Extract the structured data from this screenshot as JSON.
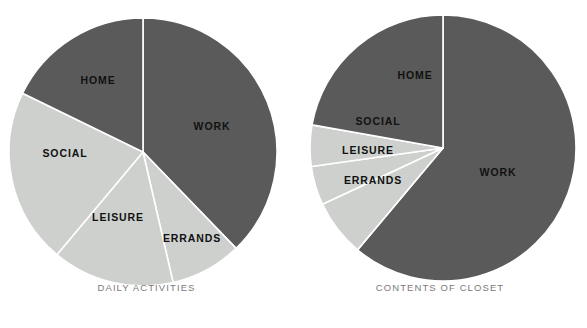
{
  "figure": {
    "background": "#ffffff",
    "label_color": "#111111",
    "caption_color": "#7a7a7a",
    "divider_color": "#ffffff"
  },
  "palette": {
    "dark": "#595a59",
    "light": "#ced0ce"
  },
  "chart_data": [
    {
      "type": "pie",
      "title": "DAILY ACTIVITIES",
      "categories": [
        "WORK",
        "ERRANDS",
        "LEISURE",
        "SOCIAL",
        "HOME"
      ],
      "values": [
        37.8,
        8.6,
        14.7,
        21.1,
        17.8
      ],
      "slices": [
        {
          "label": "WORK",
          "value": 37.8,
          "start_deg": 0,
          "end_deg": 136,
          "color": "#595a59",
          "label_x": 212,
          "label_y": 126
        },
        {
          "label": "ERRANDS",
          "value": 8.6,
          "start_deg": 136,
          "end_deg": 167,
          "color": "#ced0ce",
          "label_x": 192,
          "label_y": 238
        },
        {
          "label": "LEISURE",
          "value": 14.7,
          "start_deg": 167,
          "end_deg": 220,
          "color": "#ced0ce",
          "label_x": 118,
          "label_y": 217
        },
        {
          "label": "SOCIAL",
          "value": 21.1,
          "start_deg": 220,
          "end_deg": 296,
          "color": "#ced0ce",
          "label_x": 65,
          "label_y": 153
        },
        {
          "label": "HOME",
          "value": 17.8,
          "start_deg": 296,
          "end_deg": 360,
          "color": "#595a59",
          "label_x": 98,
          "label_y": 80
        }
      ],
      "center": {
        "x": 143,
        "y": 152
      },
      "radius": 134,
      "legend": "inside-slices",
      "grid": false
    },
    {
      "type": "pie",
      "title": "CONTENTS OF CLOSET",
      "categories": [
        "WORK",
        "ERRANDS",
        "LEISURE",
        "SOCIAL",
        "HOME"
      ],
      "values": [
        61.1,
        6.9,
        4.7,
        5.0,
        22.3
      ],
      "slices": [
        {
          "label": "WORK",
          "value": 61.1,
          "start_deg": 0,
          "end_deg": 220,
          "color": "#595a59",
          "label_x": 205,
          "label_y": 172
        },
        {
          "label": "ERRANDS",
          "value": 6.9,
          "start_deg": 220,
          "end_deg": 245,
          "color": "#ced0ce",
          "label_x": 80,
          "label_y": 180
        },
        {
          "label": "LEISURE",
          "value": 4.7,
          "start_deg": 245,
          "end_deg": 262,
          "color": "#ced0ce",
          "label_x": 75,
          "label_y": 150
        },
        {
          "label": "SOCIAL",
          "value": 5.0,
          "start_deg": 262,
          "end_deg": 280,
          "color": "#ced0ce",
          "label_x": 85,
          "label_y": 121
        },
        {
          "label": "HOME",
          "value": 22.3,
          "start_deg": 280,
          "end_deg": 360,
          "color": "#595a59",
          "label_x": 122,
          "label_y": 75
        }
      ],
      "center": {
        "x": 150,
        "y": 148
      },
      "radius": 133,
      "legend": "inside-slices",
      "grid": false
    }
  ],
  "panels": [
    {
      "id": "left",
      "caption": "DAILY ACTIVITIES",
      "caption_y": 282
    },
    {
      "id": "right",
      "caption": "CONTENTS OF CLOSET",
      "caption_y": 282
    }
  ]
}
